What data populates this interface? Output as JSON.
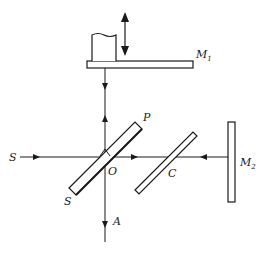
{
  "diagram": {
    "type": "Michelson interferometer",
    "labels": {
      "M1": {
        "main": "M",
        "sub": "1"
      },
      "M2": {
        "main": "M",
        "sub": "2"
      },
      "P": "P",
      "S_source": "S",
      "S_plate": "S",
      "O": "O",
      "C": "C",
      "A": "A"
    },
    "colors": {
      "stroke": "#1a1a1a",
      "background": "#ffffff"
    }
  }
}
